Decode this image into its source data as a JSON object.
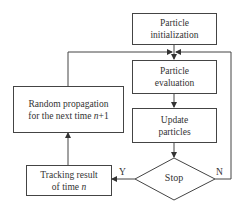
{
  "diagram": {
    "type": "flowchart",
    "nodes": {
      "init": {
        "line1": "Particle",
        "line2": "initialization"
      },
      "evaluation": {
        "line1": "Particle",
        "line2": "evaluation"
      },
      "update": {
        "line1": "Update",
        "line2": "particles"
      },
      "stop": {
        "label": "Stop"
      },
      "tracking": {
        "line1": "Tracking result",
        "line2_prefix": "of time ",
        "line2_var": "n"
      },
      "propagation": {
        "line1": "Random propagation",
        "line2_prefix": "for the next time ",
        "line2_var": "n",
        "line2_suffix": "+1"
      }
    },
    "edges": {
      "yes_label": "Y",
      "no_label": "N"
    },
    "colors": {
      "stroke": "#444444",
      "text": "#333333",
      "background": "#ffffff"
    }
  }
}
